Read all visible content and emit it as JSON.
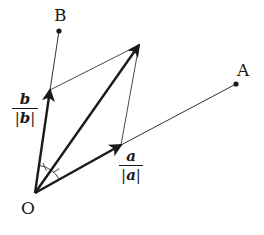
{
  "points": {
    "O": {
      "label": "O",
      "x": 35,
      "y": 193
    },
    "A": {
      "label": "A",
      "x": 236,
      "y": 84
    },
    "B": {
      "label": "B",
      "x": 59,
      "y": 31
    }
  },
  "vectors": {
    "unit_a": {
      "label_num": "a",
      "label_den_bar_left": "|",
      "label_den_letter": "a",
      "label_den_bar_right": "|",
      "tip": {
        "x": 121,
        "y": 145
      }
    },
    "unit_b": {
      "label_num": "b",
      "label_den_bar_left": "|",
      "label_den_letter": "b",
      "label_den_bar_right": "|",
      "tip": {
        "x": 50,
        "y": 90
      }
    },
    "sum": {
      "tip": {
        "x": 139,
        "y": 45
      }
    }
  },
  "annotations": {
    "equal_angle_marks": 2,
    "description": "Angle bisector: sum of unit vectors a/|a| and b/|b| bisects angle AOB"
  },
  "colors": {
    "stroke": "#1a1a1a",
    "background": "#ffffff"
  }
}
